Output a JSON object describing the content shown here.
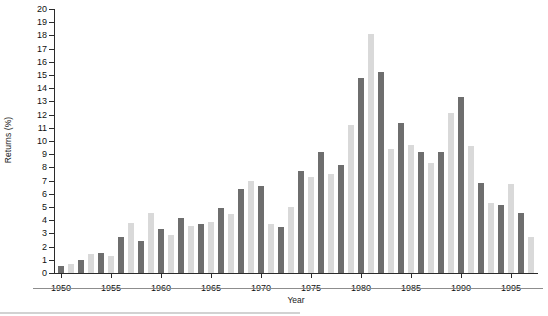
{
  "chart_data": {
    "type": "bar",
    "title": "",
    "xlabel": "Year",
    "ylabel": "Returns (%)",
    "ylim": [
      0,
      20
    ],
    "ytick_step": 1,
    "yticks": [
      0,
      1,
      2,
      3,
      4,
      5,
      6,
      7,
      8,
      9,
      10,
      11,
      12,
      13,
      14,
      15,
      16,
      17,
      18,
      19,
      20
    ],
    "xlim": [
      1949.3,
      1997.7
    ],
    "xticks": [
      1950,
      1955,
      1960,
      1965,
      1970,
      1975,
      1980,
      1985,
      1990,
      1995
    ],
    "xtick_labels": [
      "1950",
      "1955",
      "1960",
      "1965",
      "1970",
      "1975",
      "1980",
      "1985",
      "1990",
      "1995"
    ],
    "grid": false,
    "legend": "none",
    "bar_colors": {
      "dark": "#6e6e6e",
      "light": "#d9d9d9"
    },
    "categories": [
      "1950",
      "1951",
      "1952",
      "1953",
      "1954",
      "1955",
      "1956",
      "1957",
      "1958",
      "1959",
      "1960",
      "1961",
      "1962",
      "1963",
      "1964",
      "1965",
      "1966",
      "1967",
      "1968",
      "1969",
      "1970",
      "1971",
      "1972",
      "1973",
      "1974",
      "1975",
      "1976",
      "1977",
      "1978",
      "1979",
      "1980",
      "1981",
      "1982",
      "1983",
      "1984",
      "1985",
      "1986",
      "1987",
      "1988",
      "1989",
      "1990",
      "1991",
      "1992",
      "1993",
      "1994",
      "1995",
      "1996",
      "1997"
    ],
    "values": [
      0.5,
      0.7,
      0.95,
      1.45,
      1.5,
      1.3,
      2.7,
      3.8,
      2.45,
      4.55,
      3.3,
      2.85,
      4.15,
      3.55,
      3.7,
      3.85,
      4.95,
      4.5,
      6.35,
      7.0,
      6.6,
      3.7,
      3.45,
      5.0,
      7.7,
      7.3,
      9.15,
      7.5,
      8.2,
      11.2,
      14.8,
      18.1,
      15.25,
      9.4,
      11.4,
      9.7,
      9.15,
      8.3,
      9.2,
      12.15,
      13.3,
      9.6,
      6.85,
      5.3,
      5.15,
      6.75,
      4.55,
      2.75
    ],
    "shades": [
      "dark",
      "light",
      "dark",
      "light",
      "dark",
      "light",
      "dark",
      "light",
      "dark",
      "light",
      "dark",
      "light",
      "dark",
      "light",
      "dark",
      "light",
      "dark",
      "light",
      "dark",
      "light",
      "dark",
      "light",
      "dark",
      "light",
      "dark",
      "light",
      "dark",
      "light",
      "dark",
      "light",
      "dark",
      "light",
      "dark",
      "light",
      "dark",
      "light",
      "dark",
      "light",
      "dark",
      "light",
      "dark",
      "light",
      "dark",
      "light",
      "dark",
      "light",
      "dark",
      "light"
    ]
  }
}
